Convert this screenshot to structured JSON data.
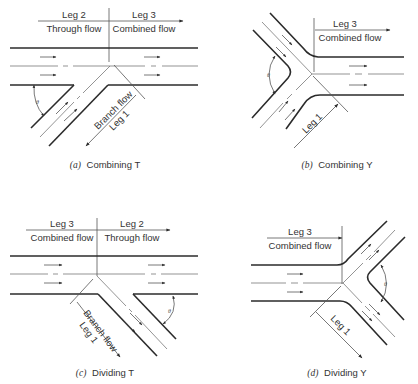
{
  "figure": {
    "panels": [
      {
        "id": "a",
        "caption_letter": "(a)",
        "caption": "Combining T",
        "labels": {
          "left_leg": "Leg 2",
          "left_flow": "Through flow",
          "right_leg": "Leg 3",
          "right_flow": "Combined flow",
          "branch_flow": "Branch flow",
          "branch_leg": "Leg 1",
          "angle": "θ"
        }
      },
      {
        "id": "b",
        "caption_letter": "(b)",
        "caption": "Combining Y",
        "labels": {
          "right_leg": "Leg 3",
          "right_flow": "Combined flow",
          "branch_leg": "Leg 1",
          "angle": "θ"
        }
      },
      {
        "id": "c",
        "caption_letter": "(c)",
        "caption": "Dividing T",
        "labels": {
          "left_leg": "Leg 3",
          "left_flow": "Combined flow",
          "right_leg": "Leg 2",
          "right_flow": "Through flow",
          "branch_flow": "Branch flow",
          "branch_leg": "Leg 1",
          "angle": "θ"
        }
      },
      {
        "id": "d",
        "caption_letter": "(d)",
        "caption": "Dividing Y",
        "labels": {
          "left_leg": "Leg 3",
          "left_flow": "Combined flow",
          "branch_leg": "Leg 1",
          "angle": "θ"
        }
      }
    ],
    "colors": {
      "line": "#2b2b2b",
      "text": "#333333",
      "background": "#ffffff"
    }
  }
}
